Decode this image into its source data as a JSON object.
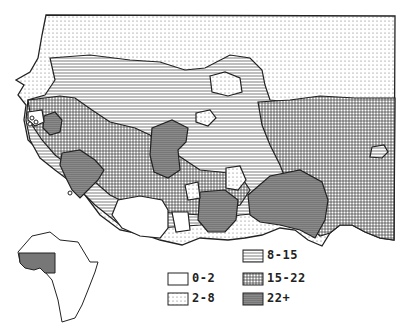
{
  "map": {
    "region": "West Africa",
    "inset": {
      "label": "Africa locator",
      "highlight_color": "#777777"
    }
  },
  "legend": {
    "items": [
      {
        "key": "0-2",
        "label": "0-2",
        "pattern": "blank"
      },
      {
        "key": "2-8",
        "label": "2-8",
        "pattern": "dots"
      },
      {
        "key": "8-15",
        "label": "8-15",
        "pattern": "horizontal-lines"
      },
      {
        "key": "15-22",
        "label": "15-22",
        "pattern": "grid"
      },
      {
        "key": "22+",
        "label": "22+",
        "pattern": "dark-lines"
      }
    ]
  },
  "colors": {
    "ink": "#222222",
    "dark_fill": "#8a8a8a",
    "background": "#ffffff"
  }
}
